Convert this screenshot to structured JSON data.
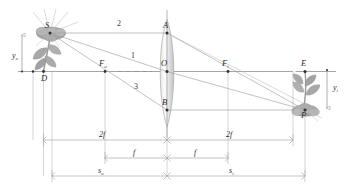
{
  "diagram": {
    "points": {
      "S": "S",
      "D": "D",
      "Fo": "F",
      "Fo_sub": "o",
      "A": "A",
      "O": "O",
      "B": "B",
      "Fi": "F",
      "Fi_sub": "i",
      "E": "E",
      "P": "P"
    },
    "rays": {
      "ray1": "1",
      "ray2": "2",
      "ray3": "3"
    },
    "heights": {
      "object": "y",
      "object_sub": "o",
      "image": "y",
      "image_sub": "i"
    },
    "dimensions": {
      "two_f_left": "2f",
      "two_f_right": "2f",
      "f_left": "f",
      "f_right": "f",
      "s_object": "s",
      "s_object_sub": "o",
      "s_image": "s",
      "s_image_sub": "i"
    },
    "colors": {
      "axis": "#8a8a8a",
      "ray": "#9a9a9a",
      "dimension": "#9b9b9b",
      "label": "#2b2b2b",
      "lens": "#c9c9c9",
      "plant": "#9e9e9e"
    }
  }
}
